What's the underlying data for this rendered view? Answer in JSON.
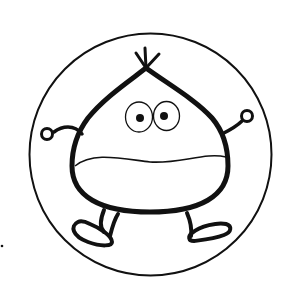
{
  "illustration": {
    "subject": "cartoon chestnut character in a circle",
    "alt": "Line drawing of a smiling chestnut character with arms raised and feet kicking, inside a circular frame",
    "colors": {
      "background": "#ffffff",
      "stroke": "#111111"
    },
    "elements": {
      "frame": "outer-circle",
      "body": "chestnut-body",
      "tuft": "stem-tuft",
      "eyes": [
        "left-eye",
        "right-eye"
      ],
      "mouth": "wide-mouth",
      "arms": [
        "left-arm",
        "right-arm"
      ],
      "legs": [
        "left-leg",
        "right-leg"
      ],
      "feet": [
        "left-foot",
        "right-foot"
      ]
    }
  }
}
